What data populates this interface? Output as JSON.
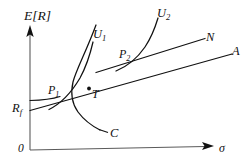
{
  "figure": {
    "type": "diagram",
    "background_color": "#ffffff",
    "line_color": "#111111",
    "text_color": "#111111"
  },
  "axes": {
    "y_label": "E[R]",
    "x_label": "σ",
    "origin_label": "0",
    "y_arrow": "up-arrow-head",
    "x_arrow": "right-arrow-head"
  },
  "labels": {
    "rf": "R",
    "rf_sub": "f",
    "u1": "U",
    "u1_sub": "1",
    "u2": "U",
    "u2_sub": "2",
    "p1": "P",
    "p1_sub": "1",
    "p2": "P",
    "p2_sub": "2",
    "tangency": "T",
    "frontier": "C",
    "line_n": "N",
    "line_a": "A"
  },
  "curves": [
    {
      "name": "efficient-frontier-C",
      "label": "C",
      "description": "hyperbola opening rightward, minimum-variance bullet"
    },
    {
      "name": "capital-market-line-A",
      "label": "A",
      "description": "straight line from Rf tangent to frontier at T, extending to upper right"
    },
    {
      "name": "borrowing-line-N",
      "label": "N",
      "description": "straight line starting at mid-left, steeper slope, crossing line A at P2"
    },
    {
      "name": "indifference-curve-U1",
      "label": "U1",
      "description": "convex increasing utility curve tangent at P1"
    },
    {
      "name": "indifference-curve-U2",
      "label": "U2",
      "description": "convex increasing utility curve tangent at P2"
    }
  ],
  "points": [
    {
      "name": "P1",
      "label": "P",
      "sub": "1",
      "description": "tangency of U1 with line A"
    },
    {
      "name": "P2",
      "label": "P",
      "sub": "2",
      "description": "tangency of U2 with line N"
    },
    {
      "name": "T",
      "label": "T",
      "sub": "",
      "description": "tangency point of line A with frontier C, marked by a dot"
    },
    {
      "name": "Rf",
      "label": "R",
      "sub": "f",
      "description": "risk-free rate intercept on vertical axis"
    }
  ]
}
